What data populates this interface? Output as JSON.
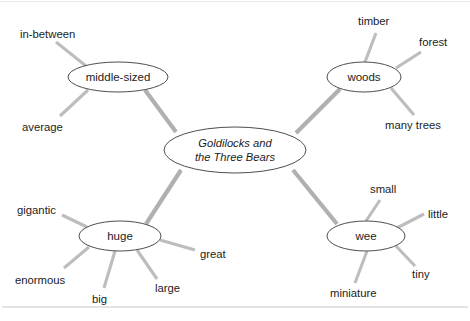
{
  "page": {
    "width": 470,
    "height": 321,
    "background_color": "#ffffff",
    "node_stroke_color": "#3a3a3a",
    "spoke_color": "#b6b6b6",
    "text_color": "#1c1c1c",
    "rule_color": "#c9c9cf"
  },
  "center": {
    "label_line1": "Goldilocks and",
    "label_line2": "the Three Bears",
    "cx": 235,
    "cy": 150,
    "rx": 71,
    "ry": 23
  },
  "branches": [
    {
      "id": "middle-sized",
      "label": "middle-sized",
      "cx": 118,
      "cy": 77,
      "rx": 50,
      "ry": 15,
      "leaves": [
        {
          "label": "in-between",
          "tx": 20,
          "ty": 38,
          "lx1": 86,
          "ly1": 66,
          "lx2": 56,
          "ly2": 42
        },
        {
          "label": "average",
          "tx": 22,
          "ty": 131,
          "lx1": 88,
          "ly1": 90,
          "lx2": 60,
          "ly2": 116
        }
      ]
    },
    {
      "id": "woods",
      "label": "woods",
      "cx": 364,
      "cy": 77,
      "rx": 37,
      "ry": 15,
      "leaves": [
        {
          "label": "timber",
          "tx": 358,
          "ty": 25,
          "lx1": 365,
          "ly1": 62,
          "lx2": 376,
          "ly2": 33
        },
        {
          "label": "forest",
          "tx": 419,
          "ty": 46,
          "lx1": 396,
          "ly1": 68,
          "lx2": 421,
          "ly2": 52
        },
        {
          "label": "many trees",
          "tx": 385,
          "ty": 129,
          "lx1": 391,
          "ly1": 88,
          "lx2": 414,
          "ly2": 115
        }
      ]
    },
    {
      "id": "huge",
      "label": "huge",
      "cx": 120,
      "cy": 236,
      "rx": 41,
      "ry": 15,
      "leaves": [
        {
          "label": "gigantic",
          "tx": 17,
          "ty": 214,
          "lx1": 87,
          "ly1": 227,
          "lx2": 62,
          "ly2": 215
        },
        {
          "label": "enormous",
          "tx": 15,
          "ty": 284,
          "lx1": 89,
          "ly1": 247,
          "lx2": 64,
          "ly2": 268
        },
        {
          "label": "big",
          "tx": 92,
          "ty": 303,
          "lx1": 115,
          "ly1": 251,
          "lx2": 104,
          "ly2": 288
        },
        {
          "label": "large",
          "tx": 155,
          "ty": 292,
          "lx1": 137,
          "ly1": 250,
          "lx2": 157,
          "ly2": 279
        },
        {
          "label": "great",
          "tx": 200,
          "ty": 258,
          "lx1": 160,
          "ly1": 240,
          "lx2": 195,
          "ly2": 250
        }
      ]
    },
    {
      "id": "wee",
      "label": "wee",
      "cx": 366,
      "cy": 236,
      "rx": 39,
      "ry": 15,
      "leaves": [
        {
          "label": "small",
          "tx": 370,
          "ty": 193,
          "lx1": 366,
          "ly1": 221,
          "lx2": 380,
          "ly2": 200
        },
        {
          "label": "little",
          "tx": 428,
          "ty": 218,
          "lx1": 397,
          "ly1": 228,
          "lx2": 424,
          "ly2": 214
        },
        {
          "label": "tiny",
          "tx": 412,
          "ty": 278,
          "lx1": 396,
          "ly1": 246,
          "lx2": 415,
          "ly2": 266
        },
        {
          "label": "miniature",
          "tx": 330,
          "ty": 297,
          "lx1": 367,
          "ly1": 251,
          "lx2": 355,
          "ly2": 283
        }
      ]
    }
  ],
  "main_spokes": [
    {
      "from": "center",
      "to": "middle-sized",
      "x1": 176,
      "y1": 132,
      "x2": 145,
      "y2": 90
    },
    {
      "from": "center",
      "to": "woods",
      "x1": 296,
      "y1": 133,
      "x2": 340,
      "y2": 89
    },
    {
      "from": "center",
      "to": "huge",
      "x1": 181,
      "y1": 170,
      "x2": 146,
      "y2": 224
    },
    {
      "from": "center",
      "to": "wee",
      "x1": 293,
      "y1": 170,
      "x2": 337,
      "y2": 224
    }
  ],
  "rules": [
    {
      "name": "top-rule",
      "x1": 0,
      "y1": 1,
      "x2": 470,
      "y2": 1
    },
    {
      "name": "bottom-rule",
      "x1": 2,
      "y1": 307,
      "x2": 468,
      "y2": 307
    }
  ]
}
